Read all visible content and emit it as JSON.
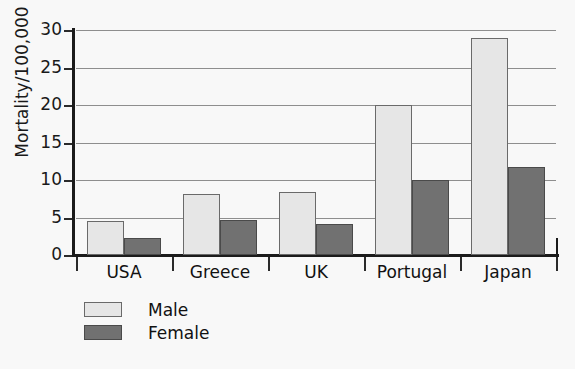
{
  "chart_data": {
    "type": "bar",
    "title": "",
    "xlabel": "",
    "ylabel": "Mortality/100,000",
    "ylim": [
      0,
      30
    ],
    "yticks": [
      0,
      5,
      10,
      15,
      20,
      25,
      30
    ],
    "grid": true,
    "legend_position": "bottom-left",
    "categories": [
      "USA",
      "Greece",
      "UK",
      "Portugal",
      "Japan"
    ],
    "series": [
      {
        "name": "Male",
        "color": "#e6e6e6",
        "values": [
          4.6,
          8.1,
          8.4,
          20.0,
          29.0
        ]
      },
      {
        "name": "Female",
        "color": "#717171",
        "values": [
          2.3,
          4.7,
          4.2,
          10.0,
          11.7
        ]
      }
    ]
  },
  "axis": {
    "y_label": "Mortality/100,000",
    "y_tick_labels": [
      "0",
      "5",
      "10",
      "15",
      "20",
      "25",
      "30"
    ]
  },
  "legend": {
    "items": [
      {
        "label": "Male"
      },
      {
        "label": "Female"
      }
    ]
  }
}
